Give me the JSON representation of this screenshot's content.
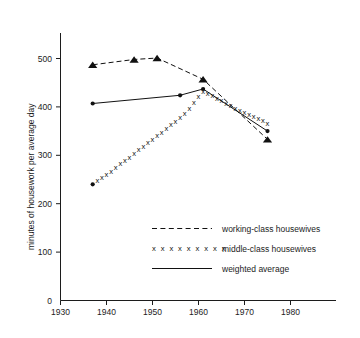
{
  "chart_data": {
    "type": "line",
    "title": "",
    "xlabel": "",
    "ylabel": "minutes of housework per average day",
    "xlim": [
      1930,
      1983
    ],
    "ylim": [
      0,
      530
    ],
    "xticks": [
      1930,
      1940,
      1950,
      1960,
      1970,
      1980
    ],
    "yticks": [
      0,
      100,
      200,
      300,
      400,
      500
    ],
    "xtick_labels": [
      "1930",
      "1940",
      "1950",
      "1960",
      "1970",
      "1980"
    ],
    "ytick_labels": [
      "0",
      "100",
      "200",
      "300",
      "400",
      "500"
    ],
    "grid": false,
    "legend_position": "lower right",
    "series": [
      {
        "name": "working-class housewives",
        "style": "dashed",
        "marker": "triangle",
        "x": [
          1937,
          1946,
          1951,
          1961,
          1975
        ],
        "values": [
          487,
          498,
          501,
          457,
          333
        ]
      },
      {
        "name": "middle-class housewives",
        "style": "x-marks",
        "marker": "x",
        "x": [
          1937,
          1938,
          1939,
          1940,
          1941,
          1942,
          1943,
          1944,
          1945,
          1946,
          1947,
          1948,
          1949,
          1950,
          1951,
          1952,
          1953,
          1954,
          1955,
          1956,
          1957,
          1958,
          1959,
          1960,
          1961,
          1962,
          1963,
          1964,
          1965,
          1966,
          1967,
          1968,
          1969,
          1970,
          1971,
          1972,
          1973,
          1974,
          1975
        ],
        "values": [
          240,
          246,
          253,
          260,
          266,
          273,
          281,
          288,
          295,
          303,
          310,
          317,
          325,
          332,
          339,
          347,
          354,
          362,
          369,
          377,
          386,
          396,
          408,
          420,
          431,
          427,
          422,
          417,
          412,
          407,
          402,
          396,
          391,
          387,
          383,
          379,
          375,
          370,
          365
        ]
      },
      {
        "name": "weighted average",
        "style": "solid",
        "marker": "dot",
        "x": [
          1937,
          1956,
          1961,
          1975
        ],
        "values": [
          407,
          424,
          437,
          350
        ]
      }
    ],
    "legend": [
      {
        "label": "working-class housewives",
        "style": "dashed"
      },
      {
        "label": "middle-class housewives",
        "style": "x-marks"
      },
      {
        "label": "weighted average",
        "style": "solid"
      }
    ],
    "x_glyph": "x",
    "legend_x_sample": "x x x x x x x x x"
  }
}
